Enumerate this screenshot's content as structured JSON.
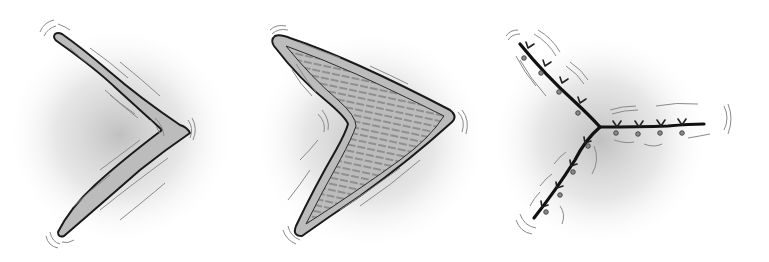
{
  "figures": [
    {
      "id": "chevron",
      "description": "thin hand-drawn chevron pointing right with motion lines"
    },
    {
      "id": "arrowhead",
      "description": "hatched filled arrowhead pointing right with motion lines"
    },
    {
      "id": "branch",
      "description": "three-pronged branch with barb marks and motion lines"
    }
  ],
  "colors": {
    "outline": "#1a1a1a",
    "fill": "#b8b8b8",
    "hatch": "#6a6a6a",
    "motion": "#7a7a7a",
    "shadow": "#9a9a9a"
  }
}
